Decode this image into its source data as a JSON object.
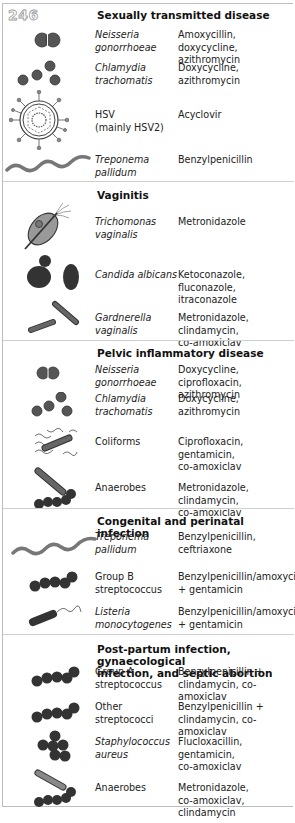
{
  "page_number": "246",
  "colors": {
    "organism_fill": "#555555",
    "organism_dark": "#2e2e2e",
    "organism_light": "#8a8a8a",
    "border": "#bdbdbd",
    "divider": "#cfcfcf"
  },
  "sections": [
    {
      "title": "Sexually transmitted disease",
      "rows": [
        {
          "organism": "Neisseria\n  gonorrhoeae",
          "italic": true,
          "treatment": "Amoxycillin, doxycycline,\n  azithromycin",
          "icon": "diplococcus-icon"
        },
        {
          "organism": "Chlamydia\n  trachomatis",
          "italic": true,
          "treatment": "Doxycycline, azithromycin",
          "icon": "chlamydia-icon"
        },
        {
          "organism": "HSV\n  (mainly HSV2)",
          "italic": false,
          "treatment": "Acyclovir",
          "icon": "herpes-virus-icon"
        },
        {
          "organism": "Treponema\n  pallidum",
          "italic": true,
          "treatment": "Benzylpenicillin",
          "icon": "spirochete-icon"
        }
      ]
    },
    {
      "title": "Vaginitis",
      "rows": [
        {
          "organism": "Trichomonas\n  vaginalis",
          "italic": true,
          "treatment": "Metronidazole",
          "icon": "trichomonas-icon"
        },
        {
          "organism": "Candida albicans",
          "italic": true,
          "treatment": "Ketoconazole, fluconazole,\n  itraconazole",
          "icon": "candida-yeast-icon"
        },
        {
          "organism": "Gardnerella\n  vaginalis",
          "italic": true,
          "treatment": "Metronidazole, clindamycin,\n  co-amoxiclav",
          "icon": "rod-bacteria-icon"
        }
      ]
    },
    {
      "title": "Pelvic inflammatory disease",
      "rows": [
        {
          "organism": "Neisseria\n  gonorrhoeae",
          "italic": true,
          "treatment": "Doxycycline, ciprofloxacin,\n  azithromycin",
          "icon": "diplococcus-icon"
        },
        {
          "organism": "Chlamydia\n  trachomatis",
          "italic": true,
          "treatment": "Doxycycline, azithromycin",
          "icon": "chlamydia-icon"
        },
        {
          "organism": "Coliforms",
          "italic": false,
          "treatment": "Ciprofloxacin, gentamicin,\n  co-amoxiclav",
          "icon": "flagellated-rod-icon"
        },
        {
          "organism": "Anaerobes",
          "italic": false,
          "treatment": "Metronidazole, clindamycin,\n  co-amoxiclav",
          "icon": "anaerobes-icon"
        }
      ]
    },
    {
      "title": "Congenital and perinatal infection",
      "rows": [
        {
          "organism": "Treponema\n  pallidum",
          "italic": true,
          "treatment": "Benzylpenicillin, ceftriaxone",
          "icon": "spirochete-icon"
        },
        {
          "organism": "Group B\n  streptococcus",
          "italic": false,
          "treatment": "Benzylpenicillin/amoxycillin\n  + gentamicin",
          "icon": "streptococcus-chain-icon"
        },
        {
          "organism": "Listeria\n  monocytogenes",
          "italic": true,
          "treatment": "Benzylpenicillin/amoxycillin\n  + gentamicin",
          "icon": "listeria-icon"
        }
      ]
    },
    {
      "title": "Post-partum infection, gynaecological\n  infection, and septic abortion",
      "rows": [
        {
          "organism": "Group A\n  streptococcus",
          "italic": false,
          "treatment": "Benzylpenicillin +\n  clindamycin, co-amoxiclav",
          "icon": "streptococcus-chain-icon"
        },
        {
          "organism": "Other\n  streptococci",
          "italic": false,
          "treatment": "Benzylpenicillin +\n  clindamycin, co-amoxiclav",
          "icon": "streptococcus-chain-icon"
        },
        {
          "organism": "Staphylococcus\n  aureus",
          "italic": true,
          "treatment": "Flucloxacillin, gentamicin,\n  co-amoxiclav",
          "icon": "staphylococcus-cluster-icon"
        },
        {
          "organism": "Anaerobes",
          "italic": false,
          "treatment": "Metronidazole,\n  co-amoxiclav, clindamycin",
          "icon": "anaerobes-icon"
        }
      ]
    }
  ]
}
